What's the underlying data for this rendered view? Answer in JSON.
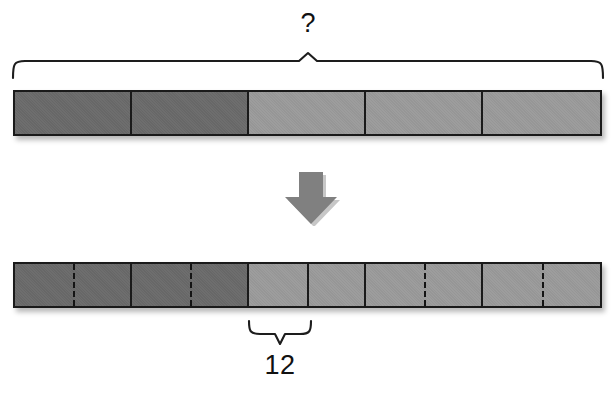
{
  "diagram": {
    "type": "tape-diagram",
    "title_text": "",
    "top_bar": {
      "name": "whole-bar",
      "segment_count": 5,
      "x": 13,
      "y": 90,
      "width": 589,
      "height": 46,
      "segments": [
        {
          "index": 1,
          "shade": "dark",
          "color": "#6a6a6a",
          "divider": "none"
        },
        {
          "index": 2,
          "shade": "dark",
          "color": "#6a6a6a",
          "divider": "none"
        },
        {
          "index": 3,
          "shade": "light",
          "color": "#9a9a9a",
          "divider": "none"
        },
        {
          "index": 4,
          "shade": "light",
          "color": "#9a9a9a",
          "divider": "none"
        },
        {
          "index": 5,
          "shade": "light",
          "color": "#9a9a9a",
          "divider": "none"
        }
      ]
    },
    "top_brace": {
      "label": "?",
      "spans_segments": "1-5",
      "x_start": 13,
      "x_end": 602,
      "peak_x": 308
    },
    "arrow": {
      "icon": "arrow-down-icon",
      "direction": "down",
      "color": "#808080",
      "x": 283,
      "y": 170,
      "width": 54,
      "height": 52
    },
    "bottom_bar": {
      "name": "partitioned-bar",
      "segment_count": 5,
      "x": 13,
      "y": 262,
      "width": 589,
      "height": 46,
      "segments": [
        {
          "index": 1,
          "shade": "dark",
          "color": "#6a6a6a",
          "divider": "dashed"
        },
        {
          "index": 2,
          "shade": "dark",
          "color": "#6a6a6a",
          "divider": "dashed"
        },
        {
          "index": 3,
          "shade": "light",
          "color": "#9a9a9a",
          "divider": "solid"
        },
        {
          "index": 4,
          "shade": "light",
          "color": "#9a9a9a",
          "divider": "dashed"
        },
        {
          "index": 5,
          "shade": "light",
          "color": "#9a9a9a",
          "divider": "dashed"
        }
      ]
    },
    "bottom_brace": {
      "label": "12",
      "spans": "half-of-segment-3",
      "x_start": 249,
      "x_end": 311,
      "point_x": 279
    },
    "colors": {
      "dark_fill": "#6a6a6a",
      "light_fill": "#9a9a9a",
      "outline": "#1a1a1a",
      "arrow_fill": "#808080",
      "text": "#111111",
      "background": "#ffffff"
    }
  },
  "chart_data": {
    "type": "bar",
    "categories": [
      "1",
      "2",
      "3",
      "4",
      "5"
    ],
    "values": [
      1,
      1,
      1,
      1,
      1
    ],
    "xlabel": "",
    "ylabel": "",
    "annotations": [
      "?",
      "12"
    ],
    "legend": []
  }
}
